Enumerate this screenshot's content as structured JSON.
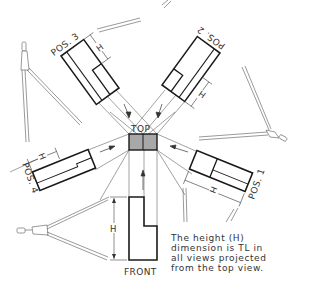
{
  "diagram": {
    "title_view_label": "TOP",
    "front_view_label": "FRONT",
    "dimension_symbol": "H",
    "positions": [
      {
        "id": 1,
        "label": "POS. 1"
      },
      {
        "id": 2,
        "label": "POS. 2"
      },
      {
        "id": 3,
        "label": "POS. 3"
      },
      {
        "id": 4,
        "label": "POS. 4"
      }
    ],
    "note_lines": [
      "The height (H)",
      "dimension is TL in",
      "all views projected",
      "from the top view."
    ],
    "colors": {
      "outline": "#1a1a1a",
      "thin_line": "#555555",
      "top_view_fill": "#a8a8a8",
      "text": "#333333",
      "background": "#ffffff"
    }
  }
}
